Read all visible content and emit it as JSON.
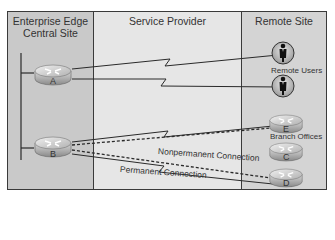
{
  "columns": {
    "central": {
      "title_line1": "Enterprise Edge",
      "title_line2": "Central Site"
    },
    "service_provider": {
      "title": "Service Provider"
    },
    "remote": {
      "title": "Remote Site"
    }
  },
  "routers": {
    "a": {
      "letter": "A",
      "icon": "router-icon"
    },
    "b": {
      "letter": "B",
      "icon": "router-icon"
    },
    "c": {
      "letter": "C",
      "icon": "router-icon"
    },
    "d": {
      "letter": "D",
      "icon": "router-icon"
    },
    "e": {
      "letter": "E",
      "icon": "router-icon"
    }
  },
  "remote_users": {
    "label": "Remote Users",
    "icon": "user-icon",
    "count": 2
  },
  "branch_offices": {
    "label": "Branch Offices"
  },
  "connections": {
    "nonpermanent": {
      "label": "Nonpermanent Connection",
      "style": "dashed"
    },
    "permanent": {
      "label": "Permanent Connection",
      "style": "solid"
    }
  },
  "colors": {
    "central_bg": "#c9c9c9",
    "service_provider_bg": "#e6e6e6",
    "remote_bg": "#d4d4d4",
    "line": "#2a2a2a"
  }
}
